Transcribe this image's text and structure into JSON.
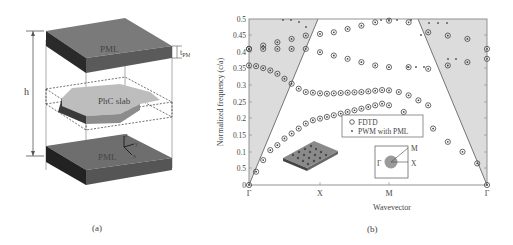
{
  "panel_a": {
    "caption": "(a)",
    "top_layer_label": "PML",
    "bottom_layer_label": "PML",
    "slab_label": "PhC slab",
    "height_label": "h",
    "thickness_label": "t",
    "thickness_sub": "PML",
    "axis_z": "z",
    "axis_y": "y",
    "axis_x": "x"
  },
  "panel_b": {
    "caption": "(b)",
    "legend": {
      "fdtd": "FDTD",
      "pwm": "PWM with PML"
    },
    "bz_inset": {
      "gamma": "Γ",
      "x": "X",
      "m": "M"
    }
  },
  "chart_data": {
    "type": "scatter",
    "title": "",
    "xlabel": "Wavevector",
    "ylabel": "Normalized frequency (c/a)",
    "x_ticks": [
      "Γ",
      "X",
      "M",
      "Γ"
    ],
    "y_ticks": [
      "0",
      "0.5",
      "0.1",
      "0.15",
      "0.2",
      "0.25",
      "0.3",
      "0.35",
      "0.4",
      "0.45",
      "0.5"
    ],
    "ylim": [
      0,
      0.5
    ],
    "grid": false,
    "legend_position": "inside lower right",
    "light_cone": "shaded gray regions above the light lines at left (Γ–X) and right (M–Γ)",
    "series": [
      {
        "name": "FDTD",
        "marker": "open circle",
        "bands": [
          {
            "k": [
              0,
              0.1,
              0.2,
              0.3,
              0.4,
              0.5,
              0.6,
              0.7,
              0.8,
              0.9,
              1.0,
              1.1,
              1.2,
              1.3,
              1.4,
              1.5,
              1.6,
              1.7,
              1.8,
              1.9,
              2.0,
              2.15,
              2.3,
              2.45,
              2.6,
              2.75,
              2.9,
              3.0
            ],
            "f": [
              0.0,
              0.04,
              0.075,
              0.105,
              0.12,
              0.14,
              0.155,
              0.17,
              0.185,
              0.195,
              0.2,
              0.205,
              0.21,
              0.215,
              0.22,
              0.225,
              0.23,
              0.235,
              0.24,
              0.245,
              0.24,
              0.22,
              0.19,
              0.17,
              0.13,
              0.1,
              0.065,
              0.0
            ]
          },
          {
            "k": [
              0,
              0.1,
              0.2,
              0.3,
              0.4,
              0.5,
              0.6,
              0.7,
              0.8,
              0.9,
              1.0,
              1.1,
              1.2,
              1.3,
              1.4,
              1.5,
              1.6,
              1.7,
              1.8,
              1.9,
              2.0,
              2.1,
              2.2,
              2.3,
              2.4
            ],
            "f": [
              0.36,
              0.358,
              0.352,
              0.345,
              0.335,
              0.32,
              0.305,
              0.29,
              0.28,
              0.278,
              0.276,
              0.275,
              0.276,
              0.277,
              0.278,
              0.279,
              0.28,
              0.282,
              0.284,
              0.286,
              0.285,
              0.28,
              0.27,
              0.255,
              0.24
            ]
          },
          {
            "k": [
              0,
              0.2,
              0.4,
              0.6,
              0.8,
              1.0,
              1.2,
              1.4,
              1.6,
              1.8,
              2.0,
              2.2,
              2.4,
              2.6,
              2.8,
              3.0
            ],
            "f": [
              0.41,
              0.41,
              0.41,
              0.41,
              0.41,
              0.4,
              0.39,
              0.38,
              0.37,
              0.36,
              0.355,
              0.355,
              0.35,
              0.36,
              0.37,
              0.38
            ]
          },
          {
            "k": [
              0,
              0.2,
              0.4,
              0.6,
              0.8,
              1.0,
              1.2,
              1.4,
              1.6,
              1.8,
              2.0,
              2.2,
              2.4,
              2.6,
              2.8,
              3.0
            ],
            "f": [
              0.41,
              0.42,
              0.43,
              0.44,
              0.45,
              0.455,
              0.46,
              0.47,
              0.48,
              0.49,
              0.495,
              0.49,
              0.46,
              0.45,
              0.44,
              0.41
            ]
          }
        ]
      },
      {
        "name": "PWM with PML",
        "marker": "dot / cross",
        "note": "points coincide with FDTD circles below the light line; scattered crosses above light line near 0.45–0.5"
      }
    ]
  }
}
